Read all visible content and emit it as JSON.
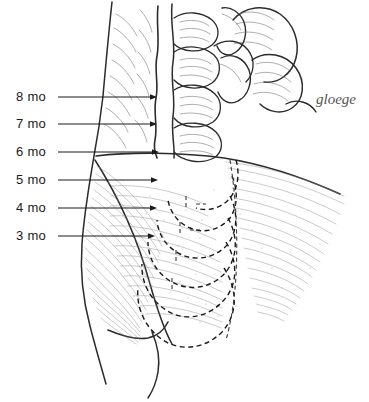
{
  "figure": {
    "background_color": "#ffffff",
    "ink_color": "#1a1a1a"
  },
  "labels": [
    {
      "id": "mo-8",
      "text": "8 mo",
      "text_x": 16,
      "text_y": 101,
      "line_y": 97,
      "line_x1": 58,
      "line_x2": 157,
      "month": 8
    },
    {
      "id": "mo-7",
      "text": "7 mo",
      "text_x": 16,
      "text_y": 128,
      "line_y": 124,
      "line_x1": 58,
      "line_x2": 157,
      "month": 7
    },
    {
      "id": "mo-6",
      "text": "6 mo",
      "text_x": 16,
      "text_y": 156,
      "line_y": 152,
      "line_x1": 58,
      "line_x2": 159,
      "month": 6
    },
    {
      "id": "mo-5",
      "text": "5 mo",
      "text_x": 16,
      "text_y": 184,
      "line_y": 180,
      "line_x1": 58,
      "line_x2": 158,
      "month": 5
    },
    {
      "id": "mo-4",
      "text": "4 mo",
      "text_x": 16,
      "text_y": 212,
      "line_y": 208,
      "line_x1": 58,
      "line_x2": 157,
      "month": 4
    },
    {
      "id": "mo-3",
      "text": "3 mo",
      "text_x": 16,
      "text_y": 240,
      "line_y": 236,
      "line_x1": 58,
      "line_x2": 155,
      "month": 3
    }
  ],
  "signature": {
    "text": "gloege",
    "x": 316,
    "y": 104
  }
}
